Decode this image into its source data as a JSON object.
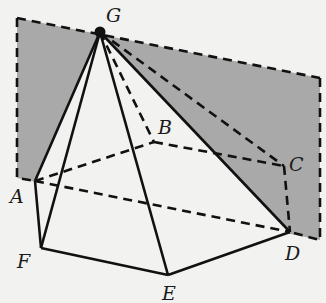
{
  "diagram": {
    "type": "geometry",
    "colors": {
      "background": "#f2f2f0",
      "plane_fill": "#a9a9a9",
      "line": "#111111"
    },
    "points": {
      "G": {
        "label": "G",
        "x": 100,
        "y": 32
      },
      "A": {
        "label": "A",
        "x": 35,
        "y": 181
      },
      "B": {
        "label": "B",
        "x": 154,
        "y": 142
      },
      "C": {
        "label": "C",
        "x": 284,
        "y": 166
      },
      "D": {
        "label": "D",
        "x": 290,
        "y": 232
      },
      "E": {
        "label": "E",
        "x": 168,
        "y": 275
      },
      "F": {
        "label": "F",
        "x": 41,
        "y": 248
      }
    },
    "labels": {
      "G": "G",
      "A": "A",
      "B": "B",
      "C": "C",
      "D": "D",
      "E": "E",
      "F": "F"
    },
    "plane_corners": [
      [
        17,
        18
      ],
      [
        320,
        78
      ],
      [
        320,
        240
      ],
      [
        17,
        178
      ]
    ],
    "solid_edges": [
      "GA",
      "GF",
      "GE",
      "GD",
      "AF",
      "FE",
      "ED"
    ],
    "dashed_edges": [
      "GB",
      "GC",
      "AB",
      "BC",
      "CD",
      "AD"
    ]
  }
}
